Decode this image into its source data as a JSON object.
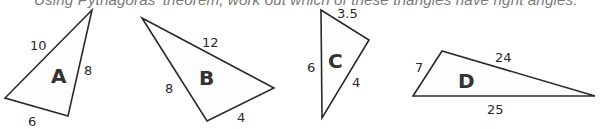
{
  "instruction": "Using Pythagoras' theorem, work out which of these triangles have right angles.",
  "colors": {
    "stroke": "#2a2a2a",
    "instruction_text": "#7a7a7a",
    "fill": "#fdfdfd"
  },
  "triangles": [
    {
      "label": "A",
      "sides": [
        "10",
        "8",
        "6"
      ],
      "points": "92,10 5,98 68,116"
    },
    {
      "label": "B",
      "sides": [
        "12",
        "8",
        "4"
      ],
      "points": "142,18 274,88 207,121"
    },
    {
      "label": "C",
      "sides": [
        "3.5",
        "6",
        "4"
      ],
      "points": "321,10 369,40 322,118"
    },
    {
      "label": "D",
      "sides": [
        "7",
        "24",
        "25"
      ],
      "points": "442,51 413,96 595,96"
    }
  ]
}
